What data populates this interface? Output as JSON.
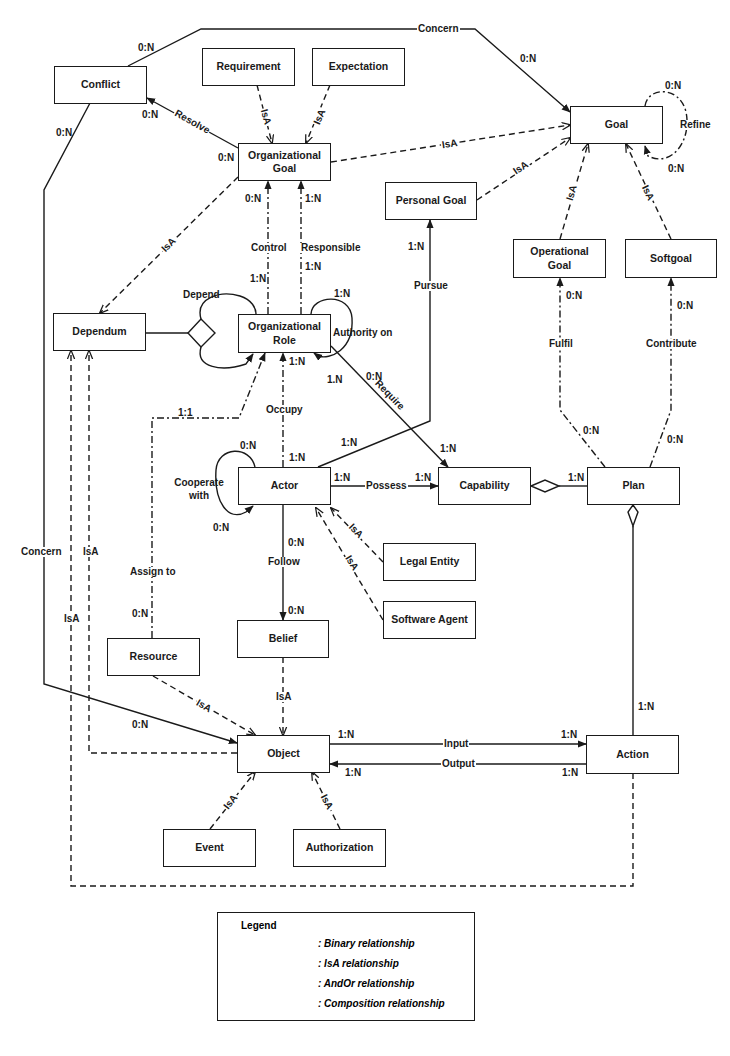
{
  "diagram": {
    "entities": {
      "conflict": "Conflict",
      "requirement": "Requirement",
      "expectation": "Expectation",
      "organizational_goal": "Organizational Goal",
      "goal": "Goal",
      "personal_goal": "Personal Goal",
      "operational_goal": "Operational Goal",
      "softgoal": "Softgoal",
      "dependum": "Dependum",
      "organizational_role": "Organizational Role",
      "actor": "Actor",
      "capability": "Capability",
      "plan": "Plan",
      "legal_entity": "Legal Entity",
      "software_agent": "Software Agent",
      "belief": "Belief",
      "resource": "Resource",
      "object": "Object",
      "action": "Action",
      "event": "Event",
      "authorization": "Authorization"
    },
    "relationships": {
      "concern_top": "Concern",
      "concern_left": "Concern",
      "resolve": "Resolve",
      "refine": "Refine",
      "control": "Control",
      "responsible": "Responsible",
      "depend": "Depend",
      "authority_on": "Authority on",
      "pursue": "Pursue",
      "fulfil": "Fulfil",
      "contribute": "Contribute",
      "require": "Require",
      "occupy": "Occupy",
      "cooperate_with": "Cooperate with",
      "possess": "Possess",
      "follow": "Follow",
      "assign_to": "Assign to",
      "input": "Input",
      "output": "Output",
      "isa": "IsA"
    },
    "cardinalities": {
      "conflict_concern_top": "0:N",
      "goal_concern": "0:N",
      "conflict_concern_left": "0:N",
      "conflict_resolve": "0:N",
      "orggoal_resolve": "0:N",
      "refine_top": "0:N",
      "refine_bottom": "0:N",
      "control_top": "0:N",
      "control_bottom": "1:N",
      "responsible_top": "1:N",
      "responsible_bottom": "1:N",
      "authority_top": "1:N",
      "authority_bottom": "1.N",
      "pursue_top": "1:N",
      "pursue_bottom": "1:N",
      "fulfil_top": "0:N",
      "fulfil_bottom": "0:N",
      "contribute_top": "0:N",
      "contribute_bottom": "0:N",
      "require_top": "0:N",
      "require_bottom": "1:N",
      "occupy_top": "1:N",
      "occupy_bottom": "1:N",
      "assign_top": "1:1",
      "assign_bottom": "0:N",
      "cooperate_top": "0:N",
      "cooperate_bottom": "0:N",
      "possess_left": "1:N",
      "possess_right": "1:N",
      "plan_capability": "1:N",
      "follow_top": "0:N",
      "follow_bottom": "0:N",
      "plan_action": "1:N",
      "object_concern": "0:N",
      "input_left": "1:N",
      "input_right": "1:N",
      "output_left": "1:N",
      "output_right": "1:N"
    },
    "legend": {
      "title": "Legend",
      "items": [
        {
          "label": ": Binary relationship",
          "style": "solid-filled-arrow"
        },
        {
          "label": ": IsA relationship",
          "style": "dashed-open-arrow"
        },
        {
          "label": ": AndOr relationship",
          "style": "dashdot-filled-arrow"
        },
        {
          "label": ": Composition relationship",
          "style": "solid-diamond"
        }
      ]
    },
    "colors": {
      "line": "#1a1a1a",
      "background": "#ffffff"
    }
  }
}
